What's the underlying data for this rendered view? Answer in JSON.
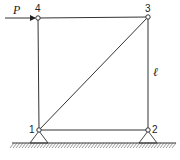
{
  "diagram": {
    "type": "truss",
    "nodes": [
      {
        "id": "1",
        "label": "1",
        "support": "pin"
      },
      {
        "id": "2",
        "label": "2",
        "support": "pin"
      },
      {
        "id": "3",
        "label": "3",
        "support": "none"
      },
      {
        "id": "4",
        "label": "4",
        "support": "none"
      }
    ],
    "members": [
      {
        "from": "1",
        "to": "2"
      },
      {
        "from": "2",
        "to": "3"
      },
      {
        "from": "3",
        "to": "4"
      },
      {
        "from": "4",
        "to": "1"
      },
      {
        "from": "1",
        "to": "3"
      }
    ],
    "load": {
      "label": "P",
      "node": "4",
      "direction": "right"
    },
    "dimension": {
      "label": "ℓ",
      "between": [
        "2",
        "3"
      ]
    }
  }
}
